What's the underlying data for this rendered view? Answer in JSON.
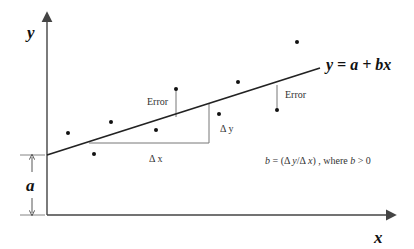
{
  "diagram": {
    "axes": {
      "x_label": "x",
      "y_label": "y"
    },
    "regression_line": {
      "equation": "y = a + bx",
      "start": [
        47,
        155
      ],
      "end": [
        320,
        68
      ]
    },
    "intercept_label": "a",
    "error_labels": [
      "Error",
      "Error"
    ],
    "delta_x_label": "Δ x",
    "delta_y_label": "Δ y",
    "slope_formula": {
      "b": "b",
      "eq": " = (Δ ",
      "y": "y",
      "slash": "/Δ ",
      "x": "x",
      "close": ") , where ",
      "b2": "b",
      "tail": " > 0"
    },
    "points": [
      [
        68,
        133
      ],
      [
        94,
        154
      ],
      [
        111,
        122
      ],
      [
        156,
        130
      ],
      [
        176,
        89
      ],
      [
        219,
        114
      ],
      [
        238,
        82
      ],
      [
        277,
        110
      ],
      [
        297,
        42
      ]
    ],
    "colors": {
      "line": "#222222",
      "axis": "#444444",
      "guide": "#777777",
      "point": "#111111"
    }
  }
}
